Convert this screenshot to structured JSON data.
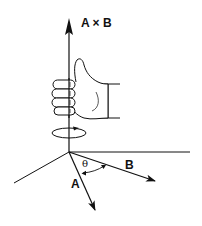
{
  "figure": {
    "labels": {
      "cross_product": "A × B",
      "vector_a": "A",
      "vector_b": "B",
      "angle": "θ"
    },
    "colors": {
      "stroke": "#111111",
      "background": "#ffffff",
      "hand_fill": "#ffffff"
    }
  }
}
